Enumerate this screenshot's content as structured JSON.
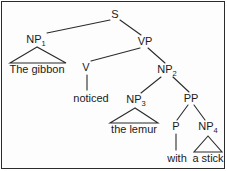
{
  "diagram": {
    "type": "syntax-tree",
    "sentence": "The gibbon noticed the lemur with a stick",
    "line_color": "#2b2b2b",
    "text_color": "#1a1a1a",
    "background_color": "#ffffff",
    "border_color": "#2b2b2b",
    "nodes": [
      {
        "id": "S",
        "label": "S",
        "sub": "",
        "x": 115,
        "y": 15,
        "kind": "nonterminal"
      },
      {
        "id": "NP1",
        "label": "NP",
        "sub": "1",
        "x": 36,
        "y": 40,
        "kind": "nonterminal"
      },
      {
        "id": "VP",
        "label": "VP",
        "sub": "",
        "x": 145,
        "y": 42,
        "kind": "nonterminal"
      },
      {
        "id": "V",
        "label": "V",
        "sub": "",
        "x": 86,
        "y": 68,
        "kind": "nonterminal"
      },
      {
        "id": "NP2",
        "label": "NP",
        "sub": "2",
        "x": 167,
        "y": 70,
        "kind": "nonterminal"
      },
      {
        "id": "NP3",
        "label": "NP",
        "sub": "3",
        "x": 136,
        "y": 100,
        "kind": "nonterminal"
      },
      {
        "id": "PP",
        "label": "PP",
        "sub": "",
        "x": 191,
        "y": 99,
        "kind": "nonterminal"
      },
      {
        "id": "P",
        "label": "P",
        "sub": "",
        "x": 176,
        "y": 127,
        "kind": "nonterminal"
      },
      {
        "id": "NP4",
        "label": "NP",
        "sub": "4",
        "x": 208,
        "y": 127,
        "kind": "nonterminal"
      }
    ],
    "leaves": [
      {
        "id": "leaf-the-gibbon",
        "text": "The gibbon",
        "x": 37,
        "y": 69,
        "parent": "NP1",
        "connector": "triangle"
      },
      {
        "id": "leaf-noticed",
        "text": "noticed",
        "x": 91,
        "y": 98,
        "parent": "V",
        "connector": "line"
      },
      {
        "id": "leaf-the-lemur",
        "text": "the lemur",
        "x": 134,
        "y": 129,
        "parent": "NP3",
        "connector": "triangle"
      },
      {
        "id": "leaf-with",
        "text": "with",
        "x": 177,
        "y": 158,
        "parent": "P",
        "connector": "line"
      },
      {
        "id": "leaf-a-stick",
        "text": "a stick",
        "x": 208,
        "y": 158,
        "parent": "NP4",
        "connector": "triangle"
      }
    ],
    "edges": [
      {
        "from": "S",
        "to": "NP1"
      },
      {
        "from": "S",
        "to": "VP"
      },
      {
        "from": "VP",
        "to": "V"
      },
      {
        "from": "VP",
        "to": "NP2"
      },
      {
        "from": "NP2",
        "to": "NP3"
      },
      {
        "from": "NP2",
        "to": "PP"
      },
      {
        "from": "PP",
        "to": "P"
      },
      {
        "from": "PP",
        "to": "NP4"
      }
    ]
  }
}
